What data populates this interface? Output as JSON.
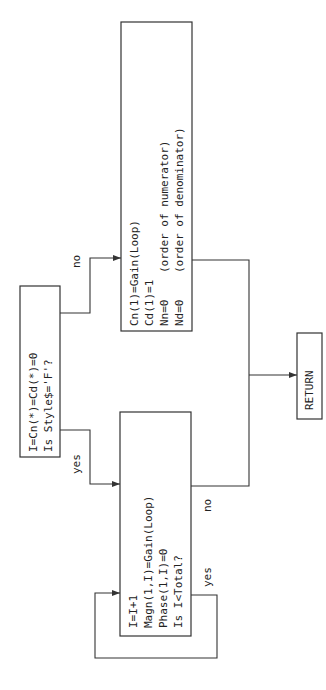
{
  "diagram": {
    "orientation": "rotated-90-ccw",
    "colors": {
      "stroke": "#333333",
      "text": "#222222",
      "background": "#ffffff"
    },
    "decision": {
      "lines": [
        "I=Cn(*)=Cd(*)=0",
        "Is Style$='F'?"
      ]
    },
    "process_no": {
      "lines": [
        "Cn(1)=Gain(Loop)",
        "Cd(1)=1",
        "Nn=0    (order of numerator)",
        "Nd=0    (order of denominator)"
      ]
    },
    "process_yes": {
      "lines": [
        "I=I+1",
        "Magn(1,I)=Gain(Loop)",
        "Phase(1,I)=0",
        "Is I<Total?"
      ]
    },
    "terminal": {
      "label": "RETURN"
    },
    "edge_labels": {
      "decision_no": "no",
      "decision_yes": "yes",
      "loop_no": "no",
      "loop_yes": "yes"
    }
  }
}
